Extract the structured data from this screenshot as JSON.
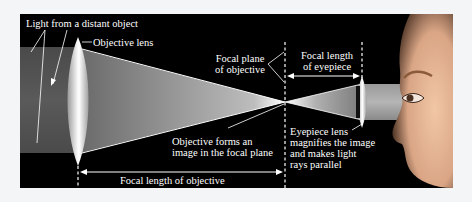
{
  "figure": {
    "labels": {
      "light_source": "Light from a distant object",
      "objective_lens": "Objective lens",
      "focal_plane": [
        "Focal plane",
        "of objective"
      ],
      "focal_length_eyepiece": [
        "Focal length",
        "of eyepiece"
      ],
      "objective_forms": [
        "Objective forms an",
        "image in the focal plane"
      ],
      "eyepiece_lens": [
        "Eyepiece lens",
        "magnifies the image",
        "and makes light",
        "rays parallel"
      ],
      "focal_length_objective": "Focal length of objective"
    },
    "colors": {
      "background": "#000000",
      "page": "#f4f5f7",
      "text": "#ffffff",
      "beam": "#8a8a8a",
      "skin": "#d9a98a"
    }
  }
}
